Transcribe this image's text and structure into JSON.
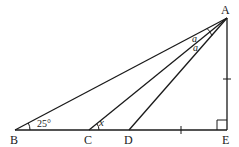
{
  "diagram": {
    "type": "geometry",
    "points": {
      "A": {
        "label": "A",
        "x": 227,
        "y": 18
      },
      "B": {
        "label": "B",
        "x": 15,
        "y": 130
      },
      "C": {
        "label": "C",
        "x": 89,
        "y": 130
      },
      "D": {
        "label": "D",
        "x": 129,
        "y": 130
      },
      "E": {
        "label": "E",
        "x": 227,
        "y": 130
      }
    },
    "segments": [
      "AB",
      "AC",
      "AD",
      "AE",
      "BE"
    ],
    "angle_labels": {
      "B": "25°",
      "C": "x",
      "A_upper": "a",
      "A_lower": "a"
    },
    "right_angle_at": "E",
    "equal_marks": [
      "AE",
      "DE"
    ],
    "stroke_color": "#1a1a1a"
  }
}
